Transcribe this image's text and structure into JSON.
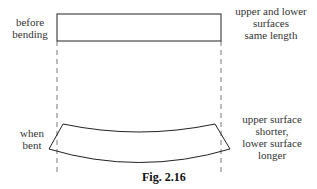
{
  "labels": {
    "before": [
      "before",
      "bending"
    ],
    "before_note": [
      "upper and lower",
      "surfaces",
      "same length"
    ],
    "bent": [
      "when",
      "bent"
    ],
    "bent_note": [
      "upper surface",
      "shorter,",
      "lower surface",
      "longer"
    ]
  },
  "caption": "Fig. 2.16",
  "colors": {
    "line": "#222222",
    "dash": "#555555"
  }
}
